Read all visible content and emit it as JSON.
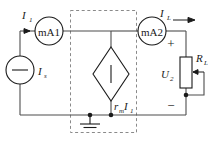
{
  "diagram": {
    "background": "#ffffff",
    "wire_color": "#4d4d4d",
    "component_color": "#1a1a1a",
    "dashed_box_color": "#8a8a8a"
  },
  "labels": {
    "input_current": "I",
    "input_current_sub": "1",
    "source_current": "I",
    "source_current_sub": "s",
    "load_current": "I",
    "load_current_sub": "L",
    "load_voltage": "U",
    "load_voltage_sub": "2",
    "load_resistor": "R",
    "load_resistor_sub": "L",
    "dependent_source_coef": "r",
    "dependent_source_coef_sub": "m",
    "dependent_source_var": "I",
    "dependent_source_var_sub": "1"
  },
  "meters": {
    "left": "mA1",
    "right": "mA2"
  },
  "polarity": {
    "plus": "+",
    "minus": "−"
  },
  "icons": {
    "current_source": "circle-with-bar-icon",
    "dependent_voltage_source": "diamond-source-icon",
    "ground": "ground-icon",
    "potentiometer": "potentiometer-icon",
    "ammeter_left": "ammeter-icon",
    "ammeter_right": "ammeter-icon",
    "current_arrow_in": "arrow-right-icon",
    "current_arrow_out": "arrow-right-icon",
    "wiper_arrow": "arrow-left-icon"
  }
}
